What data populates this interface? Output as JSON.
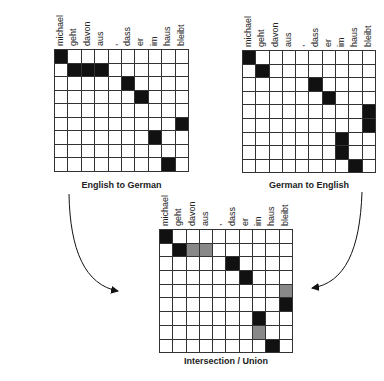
{
  "english_words": [
    "michael",
    "assumes",
    "that",
    "he",
    "will",
    "stay",
    "in",
    "the",
    "house"
  ],
  "german_words": [
    "michael",
    "geht",
    "davon",
    "aus",
    ",",
    "dass",
    "er",
    "im",
    "haus",
    "bleibt"
  ],
  "colors": {
    "aligned": "#111111",
    "union_only": "#888888",
    "grid_line": "#333333",
    "background": "#ffffff"
  },
  "matrices": [
    {
      "id": "e2g",
      "title": "English to German",
      "alignments": [
        [
          0,
          0
        ],
        [
          1,
          1
        ],
        [
          1,
          2
        ],
        [
          1,
          3
        ],
        [
          2,
          5
        ],
        [
          3,
          6
        ],
        [
          5,
          9
        ],
        [
          6,
          7
        ],
        [
          8,
          8
        ]
      ]
    },
    {
      "id": "g2e",
      "title": "German to English",
      "alignments": [
        [
          0,
          0
        ],
        [
          1,
          1
        ],
        [
          2,
          5
        ],
        [
          3,
          6
        ],
        [
          4,
          9
        ],
        [
          5,
          9
        ],
        [
          6,
          7
        ],
        [
          7,
          7
        ],
        [
          8,
          8
        ]
      ]
    },
    {
      "id": "combined",
      "title": "Intersection / Union",
      "intersection": [
        [
          0,
          0
        ],
        [
          1,
          1
        ],
        [
          2,
          5
        ],
        [
          3,
          6
        ],
        [
          5,
          9
        ],
        [
          6,
          7
        ],
        [
          8,
          8
        ]
      ],
      "union_only": [
        [
          1,
          2
        ],
        [
          1,
          3
        ],
        [
          4,
          9
        ],
        [
          7,
          7
        ]
      ]
    }
  ]
}
